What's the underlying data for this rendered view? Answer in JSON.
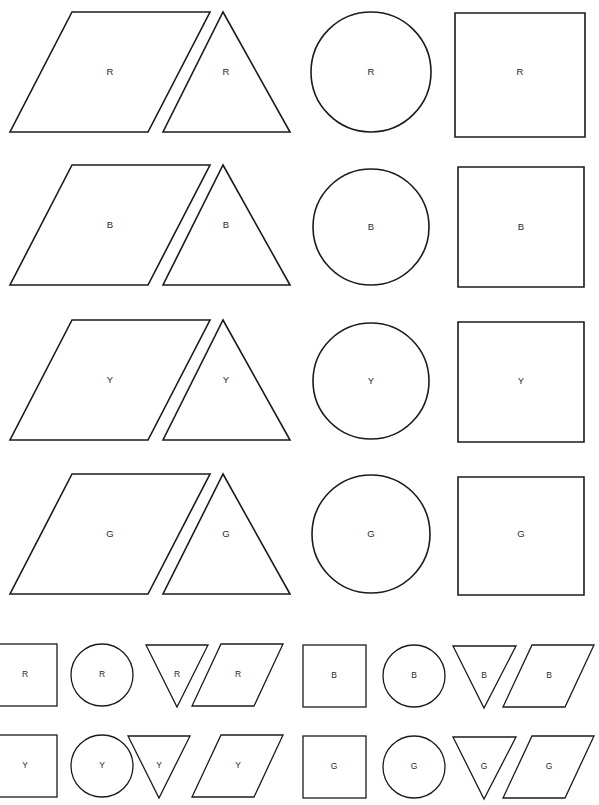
{
  "page": {
    "title_fragment": "",
    "background_color": "#ffffff",
    "ink_color": "#1b1b1b",
    "width": 599,
    "height": 805
  },
  "legend": {
    "codes": [
      {
        "code": "R",
        "meaning": "Red"
      },
      {
        "code": "B",
        "meaning": "Blue"
      },
      {
        "code": "Y",
        "meaning": "Yellow"
      },
      {
        "code": "G",
        "meaning": "Green"
      }
    ]
  },
  "large_section": {
    "shape_order": [
      "parallelogram",
      "triangle",
      "circle",
      "square"
    ],
    "rows": [
      {
        "color_code": "R",
        "cells": [
          {
            "shape": "parallelogram",
            "label": "R"
          },
          {
            "shape": "triangle",
            "label": "R"
          },
          {
            "shape": "circle",
            "label": "R"
          },
          {
            "shape": "square",
            "label": "R"
          }
        ]
      },
      {
        "color_code": "B",
        "cells": [
          {
            "shape": "parallelogram",
            "label": "B"
          },
          {
            "shape": "triangle",
            "label": "B"
          },
          {
            "shape": "circle",
            "label": "B"
          },
          {
            "shape": "square",
            "label": "B"
          }
        ]
      },
      {
        "color_code": "Y",
        "cells": [
          {
            "shape": "parallelogram",
            "label": "Y"
          },
          {
            "shape": "triangle",
            "label": "Y"
          },
          {
            "shape": "circle",
            "label": "Y"
          },
          {
            "shape": "square",
            "label": "Y"
          }
        ]
      },
      {
        "color_code": "G",
        "cells": [
          {
            "shape": "parallelogram",
            "label": "G"
          },
          {
            "shape": "triangle",
            "label": "G"
          },
          {
            "shape": "circle",
            "label": "G"
          },
          {
            "shape": "square",
            "label": "G"
          }
        ]
      }
    ]
  },
  "small_section": {
    "shape_order": [
      "square",
      "circle",
      "triangle-down",
      "parallelogram"
    ],
    "rows": [
      {
        "groups": [
          {
            "color_code": "R",
            "cells": [
              {
                "shape": "square",
                "label": "R"
              },
              {
                "shape": "circle",
                "label": "R"
              },
              {
                "shape": "triangle-down",
                "label": "R"
              },
              {
                "shape": "parallelogram",
                "label": "R"
              }
            ]
          },
          {
            "color_code": "B",
            "cells": [
              {
                "shape": "square",
                "label": "B"
              },
              {
                "shape": "circle",
                "label": "B"
              },
              {
                "shape": "triangle-down",
                "label": "B"
              },
              {
                "shape": "parallelogram",
                "label": "B"
              }
            ]
          }
        ]
      },
      {
        "groups": [
          {
            "color_code": "Y",
            "cells": [
              {
                "shape": "square",
                "label": "Y"
              },
              {
                "shape": "circle",
                "label": "Y"
              },
              {
                "shape": "triangle-down",
                "label": "Y"
              },
              {
                "shape": "parallelogram",
                "label": "Y"
              }
            ]
          },
          {
            "color_code": "G",
            "cells": [
              {
                "shape": "square",
                "label": "G"
              },
              {
                "shape": "circle",
                "label": "G"
              },
              {
                "shape": "triangle-down",
                "label": "G"
              },
              {
                "shape": "parallelogram",
                "label": "G"
              }
            ]
          }
        ]
      }
    ]
  }
}
